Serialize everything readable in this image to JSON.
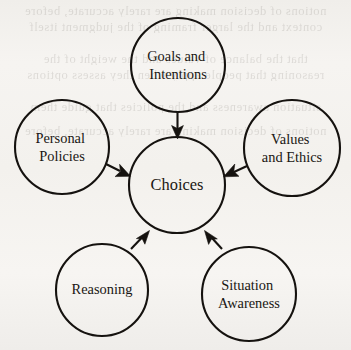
{
  "figure": {
    "type": "hub-and-spoke-diagram",
    "background_color": "#f4f2ef",
    "stroke_color": "#15120f",
    "text_color": "#1a1713",
    "width": 351,
    "height": 350
  },
  "center_node": {
    "id": "choices",
    "label": "Choices",
    "lines": [
      "Choices"
    ],
    "cx": 177,
    "cy": 185,
    "r": 48
  },
  "nodes": [
    {
      "id": "goals-and-intentions",
      "label": "Goals and Intentions",
      "lines": [
        "Goals and",
        "Intentions"
      ],
      "cx": 178,
      "cy": 65,
      "r": 47,
      "position": "top"
    },
    {
      "id": "personal-policies",
      "label": "Personal Policies",
      "lines": [
        "Personal",
        "Policies"
      ],
      "cx": 62,
      "cy": 147,
      "r": 47,
      "position": "left"
    },
    {
      "id": "values-and-ethics",
      "label": "Values and Ethics",
      "lines": [
        "Values",
        "and Ethics"
      ],
      "cx": 292,
      "cy": 148,
      "r": 48,
      "position": "right"
    },
    {
      "id": "reasoning",
      "label": "Reasoning",
      "lines": [
        "Reasoning"
      ],
      "cx": 102,
      "cy": 290,
      "r": 46,
      "position": "bottom-left"
    },
    {
      "id": "situation-awareness",
      "label": "Situation Awareness",
      "lines": [
        "Situation",
        "Awareness"
      ],
      "cx": 249,
      "cy": 294,
      "r": 47,
      "position": "bottom-right"
    }
  ],
  "arrows": [
    {
      "id": "arrow-goals-to-choices",
      "from": "goals-and-intentions",
      "to": "choices",
      "direction": "down"
    },
    {
      "id": "arrow-personal-policies-to-choices",
      "from": "personal-policies",
      "to": "choices",
      "direction": "right"
    },
    {
      "id": "arrow-values-to-choices",
      "from": "values-and-ethics",
      "to": "choices",
      "direction": "left"
    },
    {
      "id": "arrow-reasoning-to-choices",
      "from": "reasoning",
      "to": "choices",
      "direction": "up-right"
    },
    {
      "id": "arrow-situation-awareness-to-choices",
      "from": "situation-awareness",
      "to": "choices",
      "direction": "up-left"
    }
  ],
  "background_bleed": {
    "description": "faint show-through text from the reverse page of the scan",
    "lines": [
      "notions of decision making are rarely accurate, before",
      "context and the larger framing of the judgment itself",
      "that the balance of values and the weight of the",
      "reasoning that people apply when they assess options",
      "situation awareness and the policies that guide them"
    ]
  }
}
